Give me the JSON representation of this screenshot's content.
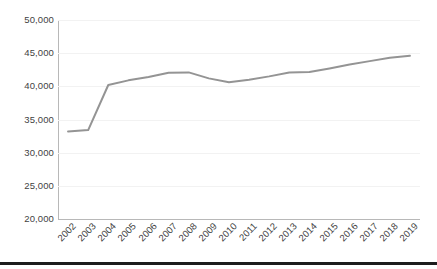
{
  "chart_data": {
    "type": "line",
    "title": "",
    "subtitle": "",
    "xlabel": "",
    "ylabel": "",
    "categories": [
      "2002",
      "2003",
      "2004",
      "2005",
      "2006",
      "2007",
      "2008",
      "2009",
      "2010",
      "2011",
      "2012",
      "2013",
      "2014",
      "2015",
      "2016",
      "2017",
      "2018",
      "2019"
    ],
    "x": [
      2002,
      2003,
      2004,
      2005,
      2006,
      2007,
      2008,
      2009,
      2010,
      2011,
      2012,
      2013,
      2014,
      2015,
      2016,
      2017,
      2018,
      2019
    ],
    "values": [
      33200,
      33400,
      40200,
      40900,
      41400,
      42050,
      42100,
      41200,
      40600,
      41000,
      41500,
      42100,
      42150,
      42700,
      43300,
      43800,
      44300,
      44600
    ],
    "series": [
      {
        "name": "Series 1",
        "values": [
          33200,
          33400,
          40200,
          40900,
          41400,
          42050,
          42100,
          41200,
          40600,
          41000,
          41500,
          42100,
          42150,
          42700,
          43300,
          43800,
          44300,
          44600
        ],
        "color": "#949494"
      }
    ],
    "ylim": [
      20000,
      50000
    ],
    "ytick_values": [
      20000,
      25000,
      30000,
      35000,
      40000,
      45000,
      50000
    ],
    "ytick_labels": [
      "20,000",
      "25,000",
      "30,000",
      "35,000",
      "40,000",
      "45,000",
      "50,000"
    ],
    "xtick_labels": [
      "2002",
      "2003",
      "2004",
      "2005",
      "2006",
      "2007",
      "2008",
      "2009",
      "2010",
      "2011",
      "2012",
      "2013",
      "2014",
      "2015",
      "2016",
      "2017",
      "2018",
      "2019"
    ],
    "grid": true,
    "grid_axis": "y",
    "legend": false,
    "legend_position": "none",
    "markers": false,
    "line_width": 2,
    "annotations": []
  },
  "style": {
    "background": "#ffffff",
    "line_color": "#949494",
    "grid_color": "#f2f2f2",
    "axis_color": "#b8b8b8",
    "text_color": "#3f3f3f",
    "rule_color": "#1c1c1c"
  }
}
